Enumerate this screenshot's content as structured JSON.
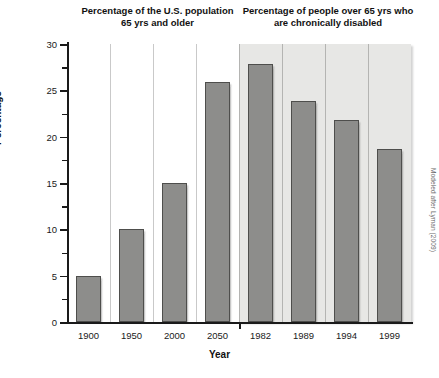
{
  "figure": {
    "credit": "Modeled after Lyman (2009)"
  },
  "titles": {
    "left": "Percentage of the U.S. population 65 yrs and older",
    "right": "Percentage of people over 65 yrs who are chronically disabled"
  },
  "axes": {
    "xlabel": "Year",
    "ylabel": "Percentage",
    "ytick_labels": [
      "0",
      "5",
      "10",
      "15",
      "20",
      "25",
      "30"
    ],
    "ytick_values": [
      0,
      5,
      10,
      15,
      20,
      25,
      30
    ],
    "yminor_values": [
      2.5,
      7.5,
      12.5,
      17.5,
      22.5,
      27.5
    ],
    "ylim": [
      0,
      30
    ]
  },
  "colors": {
    "bar_fill": "#8d8d8b",
    "bar_edge": "#4e4e4c",
    "panel_shade": "#e7e7e5",
    "background": "#ffffff",
    "text": "#1a1a1a",
    "gridline": "#c9c9c9"
  },
  "chart_data": {
    "type": "bar",
    "xlabel": "Year",
    "ylabel": "Percentage",
    "ylim": [
      0,
      30
    ],
    "grid": false,
    "legend": "none",
    "categories": [
      "1900",
      "1950",
      "2000",
      "2050",
      "1982",
      "1989",
      "1994",
      "1999"
    ],
    "values": [
      5.0,
      10.0,
      15.0,
      25.9,
      27.8,
      23.9,
      21.8,
      18.7
    ],
    "groups": [
      {
        "name": "Percentage of the U.S. population 65 yrs and older",
        "categories": [
          "1900",
          "1950",
          "2000",
          "2050"
        ],
        "values": [
          5.0,
          10.0,
          15.0,
          25.9
        ],
        "shaded": false
      },
      {
        "name": "Percentage of people over 65 yrs who are chronically disabled",
        "categories": [
          "1982",
          "1989",
          "1994",
          "1999"
        ],
        "values": [
          27.8,
          23.9,
          21.8,
          18.7
        ],
        "shaded": true
      }
    ]
  }
}
